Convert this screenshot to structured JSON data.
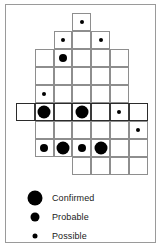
{
  "figure": {
    "type": "grid-marker-diagram",
    "width": 162,
    "height": 248,
    "background_color": "#ffffff",
    "frame_color": "#9a9a9a",
    "grid_line_color": "#8e8e8e",
    "marker_color": "#000000",
    "emphasis_band_color": "#2b2b2b"
  },
  "grid": {
    "origin_x": 16,
    "origin_y": 13,
    "cell_width": 18.8,
    "cell_height": 18.0,
    "columns": 7,
    "rows": 9,
    "cells": [
      {
        "col": 3,
        "row": 0
      },
      {
        "col": 2,
        "row": 1
      },
      {
        "col": 3,
        "row": 1
      },
      {
        "col": 4,
        "row": 1
      },
      {
        "col": 1,
        "row": 2
      },
      {
        "col": 2,
        "row": 2
      },
      {
        "col": 3,
        "row": 2
      },
      {
        "col": 4,
        "row": 2
      },
      {
        "col": 5,
        "row": 2
      },
      {
        "col": 1,
        "row": 3
      },
      {
        "col": 2,
        "row": 3
      },
      {
        "col": 3,
        "row": 3
      },
      {
        "col": 4,
        "row": 3
      },
      {
        "col": 5,
        "row": 3
      },
      {
        "col": 1,
        "row": 4
      },
      {
        "col": 2,
        "row": 4
      },
      {
        "col": 3,
        "row": 4
      },
      {
        "col": 4,
        "row": 4
      },
      {
        "col": 5,
        "row": 4
      },
      {
        "col": 0,
        "row": 5,
        "emphasis": true
      },
      {
        "col": 1,
        "row": 5,
        "emphasis": true
      },
      {
        "col": 2,
        "row": 5,
        "emphasis": true
      },
      {
        "col": 3,
        "row": 5,
        "emphasis": true
      },
      {
        "col": 4,
        "row": 5,
        "emphasis": true
      },
      {
        "col": 5,
        "row": 5,
        "emphasis": true
      },
      {
        "col": 6,
        "row": 5,
        "emphasis": true
      },
      {
        "col": 1,
        "row": 6
      },
      {
        "col": 2,
        "row": 6
      },
      {
        "col": 3,
        "row": 6
      },
      {
        "col": 4,
        "row": 6
      },
      {
        "col": 5,
        "row": 6
      },
      {
        "col": 6,
        "row": 6
      },
      {
        "col": 1,
        "row": 7
      },
      {
        "col": 2,
        "row": 7
      },
      {
        "col": 3,
        "row": 7
      },
      {
        "col": 4,
        "row": 7
      },
      {
        "col": 5,
        "row": 7
      },
      {
        "col": 6,
        "row": 7
      },
      {
        "col": 3,
        "row": 8
      },
      {
        "col": 4,
        "row": 8
      },
      {
        "col": 5,
        "row": 8
      },
      {
        "col": 6,
        "row": 8
      }
    ],
    "emphasis_band": {
      "col_start": 0,
      "col_end": 6,
      "row": 5
    },
    "markers": [
      {
        "col": 3,
        "row": 0,
        "category": "possible"
      },
      {
        "col": 2,
        "row": 1,
        "category": "possible"
      },
      {
        "col": 4,
        "row": 1,
        "category": "possible"
      },
      {
        "col": 2,
        "row": 2,
        "category": "probable"
      },
      {
        "col": 1,
        "row": 4,
        "category": "possible"
      },
      {
        "col": 1,
        "row": 5,
        "category": "confirmed"
      },
      {
        "col": 3,
        "row": 5,
        "category": "confirmed"
      },
      {
        "col": 5,
        "row": 5,
        "category": "possible"
      },
      {
        "col": 6,
        "row": 6,
        "category": "possible"
      },
      {
        "col": 1,
        "row": 7,
        "category": "probable"
      },
      {
        "col": 2,
        "row": 7,
        "category": "confirmed"
      },
      {
        "col": 3,
        "row": 7,
        "category": "probable"
      },
      {
        "col": 4,
        "row": 7,
        "category": "confirmed"
      }
    ]
  },
  "legend": {
    "items": [
      {
        "category": "confirmed",
        "label": "Confirmed"
      },
      {
        "category": "probable",
        "label": "Probable"
      },
      {
        "category": "possible",
        "label": "Possible"
      }
    ]
  }
}
